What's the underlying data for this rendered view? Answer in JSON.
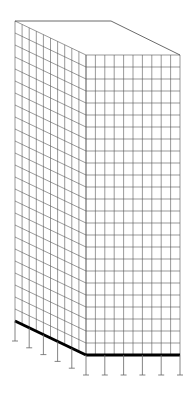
{
  "diagram": {
    "title": "",
    "left_face": {
      "columns": 10,
      "rows": 25,
      "supports": 6
    },
    "right_face": {
      "columns": 10,
      "rows": 25,
      "supports": 6
    },
    "colors": {
      "mesh": "#555555",
      "outline": "#444444",
      "base": "#000000",
      "support": "#666666",
      "background": "#ffffff"
    }
  }
}
